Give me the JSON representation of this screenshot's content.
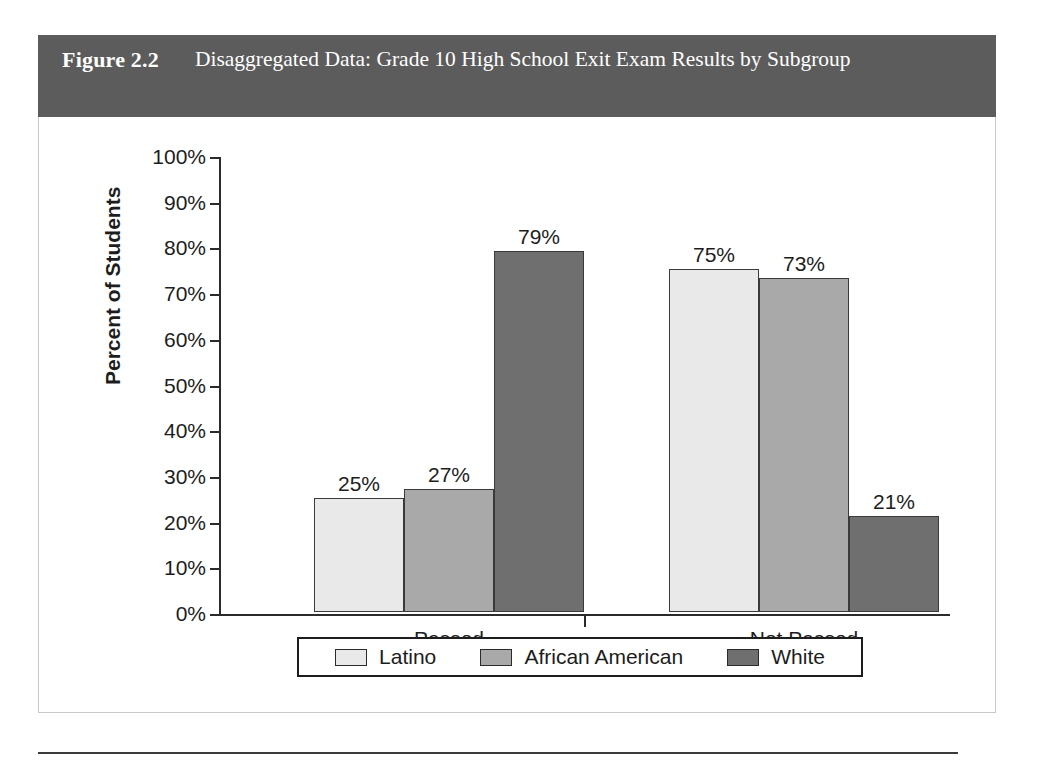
{
  "figure": {
    "number": "Figure 2.2",
    "title": "Disaggregated Data: Grade 10 High School Exit Exam Results by Subgroup",
    "caption": ""
  },
  "colors": {
    "header_bar": "#5c5c5c",
    "series_latino": "#e9e9e9",
    "series_african_american": "#a9a9a9",
    "series_white": "#6f6f6f",
    "axis": "#2b2b2b",
    "panel_border": "#c9c9c9"
  },
  "chart_data": {
    "type": "bar",
    "title": "Disaggregated Data: Grade 10 High School Exit Exam Results by Subgroup",
    "xlabel": "",
    "ylabel": "Percent of Students",
    "categories": [
      "Passed",
      "Not Passed"
    ],
    "series": [
      {
        "name": "Latino",
        "values": [
          25,
          75
        ],
        "labels": [
          "25%",
          "75%"
        ]
      },
      {
        "name": "African American",
        "values": [
          27,
          73
        ],
        "labels": [
          "27%",
          "73%"
        ]
      },
      {
        "name": "White",
        "values": [
          79,
          21
        ],
        "labels": [
          "79%",
          "21%"
        ]
      }
    ],
    "ylim": [
      0,
      100
    ],
    "ytick_values": [
      0,
      10,
      20,
      30,
      40,
      50,
      60,
      70,
      80,
      90,
      100
    ],
    "ytick_labels": [
      "0%",
      "10%",
      "20%",
      "30%",
      "40%",
      "50%",
      "60%",
      "70%",
      "80%",
      "90%",
      "100%"
    ],
    "grid": false,
    "legend_position": "bottom",
    "data_labels": true
  }
}
